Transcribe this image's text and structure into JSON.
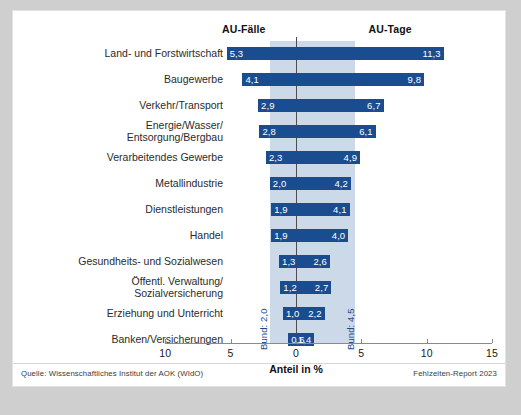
{
  "figure": {
    "headers": {
      "left": "AU-Fälle",
      "right": "AU-Tage"
    },
    "axis_title": "Anteil in %",
    "bund_left": "Bund: 2,0",
    "bund_right": "Bund: 4,5",
    "source": "Quelle: Wissenschaftliches Institut der AOK (WIdO)",
    "report": "Fehlzeiten-Report 2023"
  },
  "chart_data": {
    "type": "bar",
    "title": "",
    "subtitle": "",
    "xlabel": "Anteil in %",
    "ylabel": "",
    "orientation": "horizontal",
    "style": "bidirectional (tornado) bar chart, single bar per category spanning left and right of zero",
    "xlim": [
      -10,
      15
    ],
    "xticks": [
      -10,
      -5,
      0,
      5,
      10,
      15
    ],
    "xticklabels": [
      "10",
      "5",
      "0",
      "5",
      "10",
      "15"
    ],
    "grid": false,
    "legend": "column headers above the plot",
    "reference_bands": {
      "label_left": "Bund: 2,0",
      "label_right": "Bund: 4,5",
      "left_value": 2.0,
      "right_value": 4.5,
      "color": "#ccd9e8"
    },
    "bar_color": "#1a4d8f",
    "categories": [
      "Land- und Forstwirtschaft",
      "Baugewerbe",
      "Verkehr/Transport",
      "Energie/Wasser/\nEntsorgung/Bergbau",
      "Verarbeitendes Gewerbe",
      "Metallindustrie",
      "Dienstleistungen",
      "Handel",
      "Gesundheits- und Sozialwesen",
      "Öffentl. Verwaltung/\nSozialversicherung",
      "Erziehung und Unterricht",
      "Banken/Versicherungen"
    ],
    "series": [
      {
        "name": "AU-Fälle",
        "direction": "left",
        "values": [
          5.3,
          4.1,
          2.9,
          2.8,
          2.3,
          2.0,
          1.9,
          1.9,
          1.3,
          1.2,
          1.0,
          0.6
        ],
        "labels": [
          "5,3",
          "4,1",
          "2,9",
          "2,8",
          "2,3",
          "2,0",
          "1,9",
          "1,9",
          "1,3",
          "1,2",
          "1,0",
          "0,6"
        ]
      },
      {
        "name": "AU-Tage",
        "direction": "right",
        "values": [
          11.3,
          9.8,
          6.7,
          6.1,
          4.9,
          4.2,
          4.1,
          4.0,
          2.6,
          2.7,
          2.2,
          1.4
        ],
        "labels": [
          "11,3",
          "9,8",
          "6,7",
          "6,1",
          "4,9",
          "4,2",
          "4,1",
          "4,0",
          "2,6",
          "2,7",
          "2,2",
          "1,4"
        ]
      }
    ],
    "source": "Quelle: Wissenschaftliches Institut der AOK (WIdO)",
    "annotation": "Fehlzeiten-Report 2023"
  }
}
